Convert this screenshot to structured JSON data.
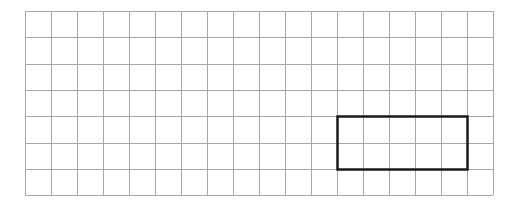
{
  "diagram": {
    "type": "grid-with-rectangle",
    "grid": {
      "columns": 18,
      "rows": 7,
      "origin_x": 25,
      "origin_y": 11,
      "cell_width": 26,
      "cell_height": 26.3,
      "line_color": "#a6a6a6",
      "line_width": 1
    },
    "rectangle": {
      "col_start": 12,
      "col_end": 17,
      "row_start": 4,
      "row_end": 6,
      "width_cells": 5,
      "height_cells": 2,
      "stroke_color": "#1a1a1a",
      "stroke_width": 2.5
    }
  }
}
